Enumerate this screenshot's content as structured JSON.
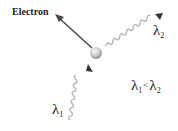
{
  "diagram": {
    "electron_label": "Electron",
    "incident_photon": {
      "symbol": "λ",
      "subscript": "1"
    },
    "scattered_photon": {
      "symbol": "λ",
      "subscript": "2"
    },
    "relation": {
      "left_symbol": "λ",
      "left_sub": "1",
      "operator": "<",
      "right_symbol": "λ",
      "right_sub": "2"
    },
    "colors": {
      "arrow": "#444444",
      "wave": "#b5b5b5",
      "electron_sphere": "#c8c8c8",
      "text": "#222222"
    }
  }
}
